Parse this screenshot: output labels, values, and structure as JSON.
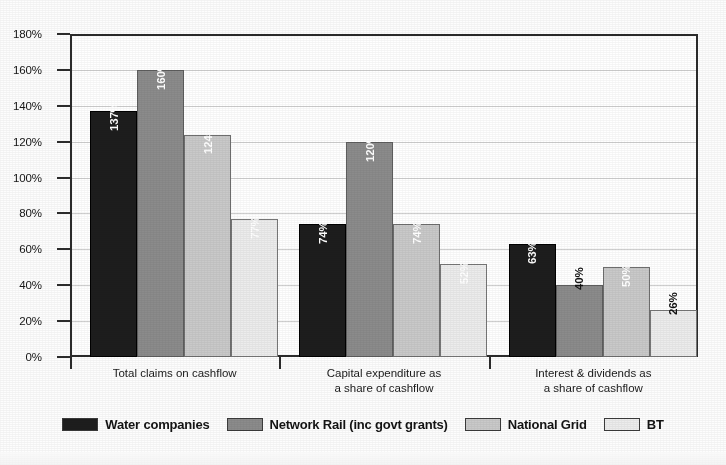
{
  "chart_data": {
    "type": "bar",
    "title": "",
    "xlabel": "",
    "ylabel": "",
    "ylim": [
      0,
      180
    ],
    "grid": true,
    "legend_position": "bottom",
    "y_unit": "%",
    "y_ticks": [
      "0%",
      "20%",
      "40%",
      "60%",
      "80%",
      "100%",
      "120%",
      "140%",
      "160%",
      "180%"
    ],
    "y_tick_values": [
      0,
      20,
      40,
      60,
      80,
      100,
      120,
      140,
      160,
      180
    ],
    "categories": [
      "Total claims on cashflow",
      "Capital expenditure as a share of cashflow",
      "Interest & dividends as a share of cashflow"
    ],
    "category_lines": [
      [
        "Total claims on cashflow"
      ],
      [
        "Capital expenditure as",
        "a share of cashflow"
      ],
      [
        "Interest & dividends as",
        "a share of cashflow"
      ]
    ],
    "series": [
      {
        "name": "Water companies",
        "color": "#1d1d1d",
        "values": [
          137,
          74,
          63
        ],
        "labels": [
          "137%",
          "74%",
          "63%"
        ]
      },
      {
        "name": "Network Rail (inc govt grants)",
        "color": "#8b8b8b",
        "values": [
          160,
          120,
          40
        ],
        "labels": [
          "160%",
          "120%",
          "40%"
        ]
      },
      {
        "name": "National Grid",
        "color": "#c9c9c9",
        "values": [
          124,
          74,
          50
        ],
        "labels": [
          "124%",
          "74%",
          "50%"
        ]
      },
      {
        "name": "BT",
        "color": "#ececec",
        "values": [
          77,
          52,
          26
        ],
        "labels": [
          "77%",
          "52%",
          "26%"
        ]
      }
    ]
  }
}
